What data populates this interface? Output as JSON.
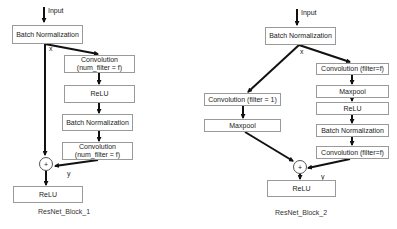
{
  "block1": {
    "caption": "ResNet_Block_1",
    "input_label": "Input",
    "x_label": "x",
    "y_label": "y",
    "sum_symbol": "+",
    "boxes": [
      {
        "label": "Batch Normalization"
      },
      {
        "label": "Convolution\n(num_filter = f)"
      },
      {
        "label": "ReLU"
      },
      {
        "label": "Batch Normalization"
      },
      {
        "label": "Convolution\n(num_filter = f)"
      },
      {
        "label": "ReLU"
      }
    ]
  },
  "block2": {
    "caption": "ResNet_Block_2",
    "input_label": "Input",
    "x_label": "x",
    "y_label": "y",
    "sum_symbol": "+",
    "boxes": [
      {
        "label": "Batch Normalization"
      },
      {
        "label": "Convolution (filter = 1)"
      },
      {
        "label": "Maxpool"
      },
      {
        "label": "Convolution (filter=f)"
      },
      {
        "label": "Maxpool"
      },
      {
        "label": "ReLU"
      },
      {
        "label": "Batch Normalization"
      },
      {
        "label": "Convolution (filter=f)"
      },
      {
        "label": "ReLU"
      }
    ]
  }
}
